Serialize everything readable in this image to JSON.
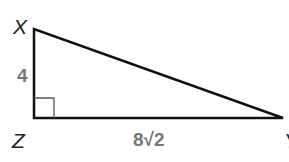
{
  "diagram": {
    "type": "right triangle",
    "vertices": {
      "X": "X",
      "Z": "Z",
      "Y": "Y"
    },
    "right_angle_at": "Z",
    "sides": {
      "XZ": "4",
      "ZY": "8√2"
    },
    "colors": {
      "stroke": "#111111",
      "side_label": "#777777",
      "vertex_label": "#222222"
    }
  }
}
